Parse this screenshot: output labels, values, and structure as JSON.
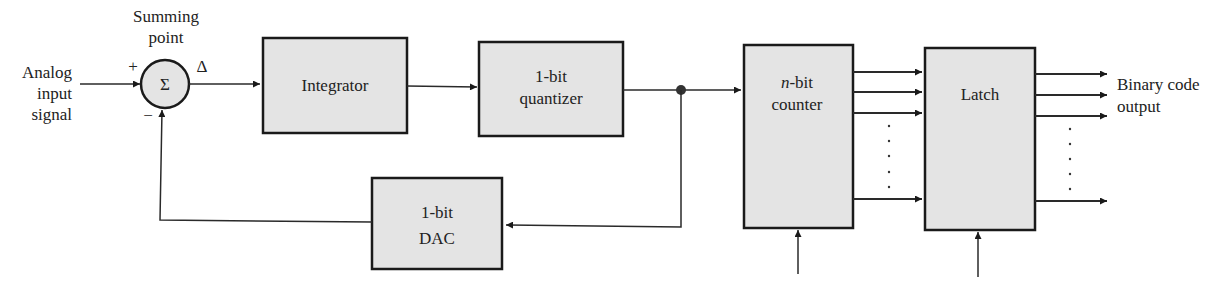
{
  "diagram": {
    "input_label": [
      "Analog",
      "input",
      "signal"
    ],
    "summing_point": {
      "label": [
        "Summing",
        "point"
      ],
      "symbol": "Σ",
      "plus_sign": "+",
      "minus_sign": "−",
      "delta_label": "Δ"
    },
    "blocks": {
      "integrator": [
        "Integrator"
      ],
      "quantizer": [
        "1-bit",
        "quantizer"
      ],
      "dac": [
        "1-bit",
        "DAC"
      ],
      "counter": {
        "italic_prefix": "n",
        "line1_rest": "-bit",
        "line2": "counter"
      },
      "latch": [
        "Latch"
      ]
    },
    "output_label": [
      "Binary code",
      "output"
    ],
    "ellipsis_dot": "."
  },
  "colors": {
    "block_fill": "#e4e4e4",
    "stroke": "#1a1a1a",
    "background": "#ffffff"
  }
}
